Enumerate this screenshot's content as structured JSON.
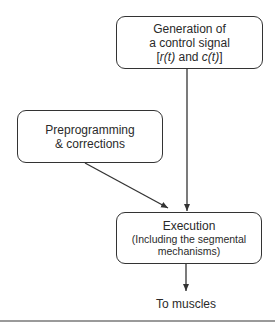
{
  "nodes": {
    "generation": {
      "lines": [
        "Generation of",
        "a control signal"
      ],
      "signal_prefix": "[",
      "signal_r": "r(t)",
      "signal_and": " and ",
      "signal_c": "c(t)",
      "signal_suffix": "]"
    },
    "preprogramming": {
      "lines": [
        "Preprogramming",
        "& corrections"
      ]
    },
    "execution": {
      "title": "Execution",
      "subtitle_lines": [
        "(Including the segmental",
        "mechanisms)"
      ]
    }
  },
  "output_label": "To muscles",
  "edges": [
    {
      "from": "generation",
      "to": "execution"
    },
    {
      "from": "preprogramming",
      "to": "execution"
    },
    {
      "from": "execution",
      "to": "output_label"
    }
  ],
  "colors": {
    "stroke": "#333333",
    "text": "#2a2a2a",
    "rule": "#9a9a9a"
  }
}
